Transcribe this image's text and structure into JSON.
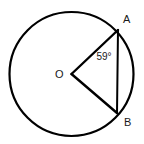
{
  "figure": {
    "type": "geometry-diagram",
    "background_color": "#ffffff",
    "stroke_color": "#000000",
    "label_color": "#1a1a1a",
    "circle": {
      "center_label": "O",
      "center_x": 71.5,
      "center_y": 74,
      "radius": 62,
      "stroke_width": 2.2
    },
    "points": [
      {
        "label": "A",
        "x": 118,
        "y": 30,
        "label_x": 123,
        "label_y": 20
      },
      {
        "label": "B",
        "x": 117,
        "y": 113,
        "label_x": 124,
        "label_y": 123
      },
      {
        "label": "O",
        "x": 71.5,
        "y": 74,
        "label_x": 59,
        "label_y": 75
      }
    ],
    "segments": [
      {
        "name": "radius-oa",
        "from": "O",
        "to": "A",
        "stroke_width": 2.4
      },
      {
        "name": "radius-ob",
        "from": "O",
        "to": "B",
        "stroke_width": 2.4
      },
      {
        "name": "chord-ab",
        "from": "A",
        "to": "B",
        "stroke_width": 2.0
      }
    ],
    "angle": {
      "name": "central-angle-aob",
      "vertex": "O",
      "value": "59",
      "unit": "°",
      "text": "59°",
      "label_x": 104,
      "label_y": 57
    }
  }
}
